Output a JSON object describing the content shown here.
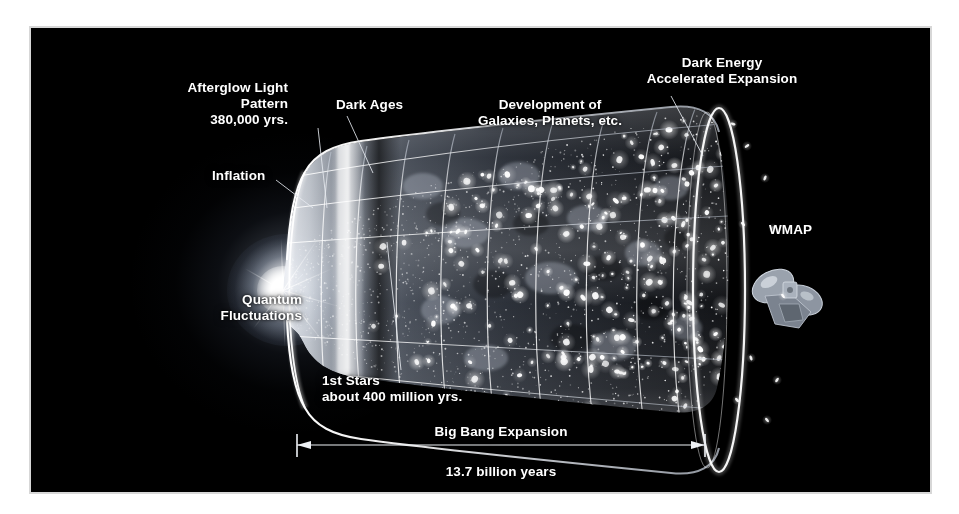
{
  "figure": {
    "background_color": "#000000",
    "mount_color": "#ffffff",
    "text_color": "#ffffff"
  },
  "annotations": {
    "afterglow": "Afterglow Light\nPattern\n380,000 yrs.",
    "dark_ages": "Dark Ages",
    "development": "Development of\nGalaxies, Planets, etc.",
    "dark_energy": "Dark Energy\nAccelerated Expansion",
    "inflation": "Inflation",
    "quantum": "Quantum\nFluctuations",
    "first_stars": "1st Stars\nabout 400 million yrs.",
    "wmap": "WMAP"
  },
  "scale_bar": {
    "caption": "Big Bang Expansion",
    "duration": "13.7 billion years"
  },
  "chart_data": {
    "type": "diagram",
    "total_span_label": "13.7 billion years",
    "total_span_value": 13.7,
    "span_units": "billion years",
    "epochs": [
      {
        "name": "Quantum Fluctuations",
        "time_label": "",
        "order": 1
      },
      {
        "name": "Inflation",
        "time_label": "",
        "order": 2
      },
      {
        "name": "Afterglow Light Pattern",
        "time_label": "380,000 yrs.",
        "order": 3
      },
      {
        "name": "Dark Ages",
        "time_label": "",
        "order": 4
      },
      {
        "name": "1st Stars",
        "time_label": "about 400 million yrs.",
        "order": 5
      },
      {
        "name": "Development of Galaxies, Planets, etc.",
        "time_label": "",
        "order": 6
      },
      {
        "name": "Dark Energy Accelerated Expansion",
        "time_label": "",
        "order": 7
      }
    ],
    "instrument": "WMAP",
    "axis_label": "Big Bang Expansion",
    "grid": true,
    "legend": "none"
  }
}
